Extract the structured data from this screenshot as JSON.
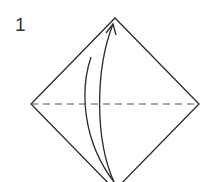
{
  "diagram": {
    "type": "origami-instruction",
    "step_number": "1",
    "paper": {
      "shape": "square-diamond",
      "vertices": {
        "top": [
          115,
          18
        ],
        "left": [
          31,
          104
        ],
        "right": [
          199,
          104
        ],
        "bottom": [
          115,
          190
        ]
      },
      "stroke_color": "#2a2a2a"
    },
    "fold_line": {
      "style": "valley-dashed",
      "from": [
        31,
        104
      ],
      "to": [
        199,
        104
      ],
      "color": "#555555"
    },
    "arrow": {
      "meaning": "fold bottom corner up to top corner",
      "from": "bottom",
      "to": "top",
      "color": "#2a2a2a"
    }
  }
}
